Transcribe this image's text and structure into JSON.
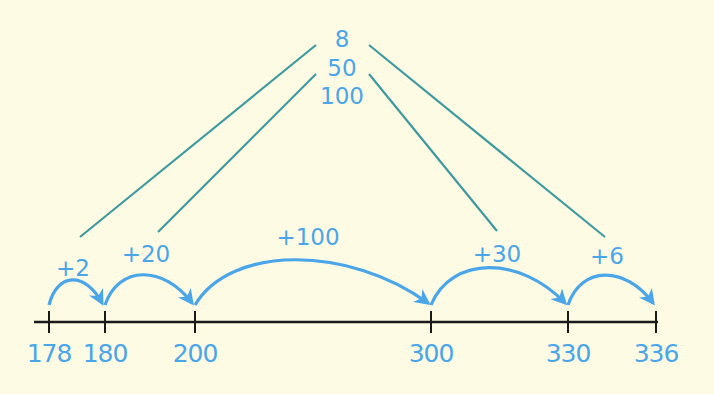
{
  "diagram": {
    "colors": {
      "background": "#fdfbe3",
      "number_text": "#4aa6e8",
      "jump_arc": "#4aa6e8",
      "connector_line": "#3e9aa0",
      "axis": "#1a1a1a"
    },
    "number_line": {
      "ticks": [
        "178",
        "180",
        "200",
        "300",
        "330",
        "336"
      ]
    },
    "jumps": [
      {
        "label": "+2",
        "from": "178",
        "to": "180"
      },
      {
        "label": "+20",
        "from": "180",
        "to": "200"
      },
      {
        "label": "+100",
        "from": "200",
        "to": "300"
      },
      {
        "label": "+30",
        "from": "300",
        "to": "330"
      },
      {
        "label": "+6",
        "from": "330",
        "to": "336"
      }
    ],
    "addend_parts": [
      "8",
      "50",
      "100"
    ]
  }
}
